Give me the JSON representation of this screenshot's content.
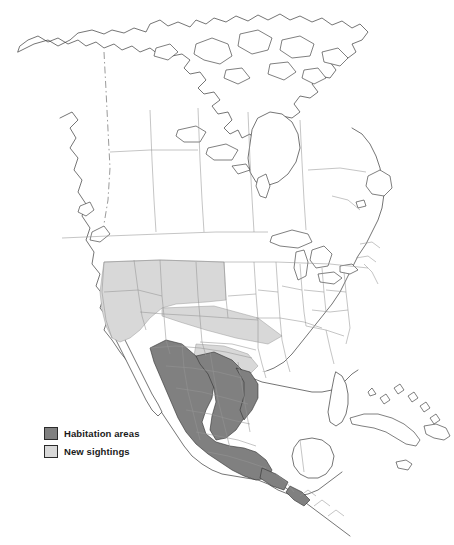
{
  "figure": {
    "kind": "distribution-map",
    "region": "North America",
    "background_color": "#ffffff",
    "outline_color": "#3a3a3a",
    "border_color": "#8d8d8d"
  },
  "legend": {
    "items": [
      {
        "label": "Habitation areas",
        "color": "#808080",
        "swatch_name": "habitation-areas-swatch"
      },
      {
        "label": "New sightings",
        "color": "#d8d8d8",
        "swatch_name": "new-sightings-swatch"
      }
    ]
  },
  "map_data": {
    "type": "choropleth",
    "classes": [
      {
        "name": "Habitation areas",
        "fill": "#808080",
        "areas": [
          "Sonora",
          "Sinaloa",
          "Chihuahua (west)",
          "Durango",
          "Nayarit",
          "Zacatecas",
          "Jalisco",
          "Aguascalientes",
          "Guanajuato",
          "Michoacan",
          "Colima",
          "Queretaro",
          "Hidalgo",
          "Mexico State",
          "Morelos",
          "Puebla",
          "Guerrero",
          "Oaxaca (coast)",
          "Chiapas (coast)"
        ]
      },
      {
        "name": "New sightings",
        "fill": "#d8d8d8",
        "areas": [
          "California",
          "Nevada",
          "Utah",
          "Arizona",
          "New Mexico",
          "West Texas corridor",
          "Coahuila (north)",
          "Nuevo Leon (north)",
          "Tamaulipas (north)"
        ]
      }
    ]
  }
}
